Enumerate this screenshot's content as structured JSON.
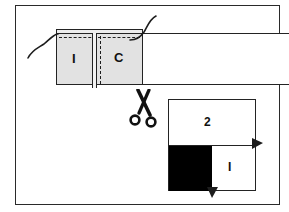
{
  "figure": {
    "width": 289,
    "height": 212,
    "background_color": "#ffffff",
    "frame_color": "#2a2a2a",
    "ink_color": "#232323",
    "panel_fill_color": "#e2e2e2",
    "block_fill_color": "#000000"
  },
  "fabric_strip": {
    "name": "long fabric band",
    "panel": {
      "label_left": "I",
      "label_right": "C",
      "fill_color": "#e2e2e2",
      "seam_style": "dashed"
    },
    "threads": [
      {
        "name": "thread-left",
        "description": "curved thread at left edge"
      },
      {
        "name": "thread-right",
        "description": "curved thread at top right corner"
      }
    ]
  },
  "scissors": {
    "name": "scissors-icon",
    "description": "cut here",
    "color": "#111111"
  },
  "square_diagram": {
    "name": "folded square",
    "label_top": "2",
    "label_bottom_right": "I",
    "black_block_color": "#000000",
    "markers": [
      {
        "name": "arrow-right",
        "position": "right edge"
      },
      {
        "name": "arrow-bottom",
        "position": "bottom edge"
      }
    ]
  }
}
